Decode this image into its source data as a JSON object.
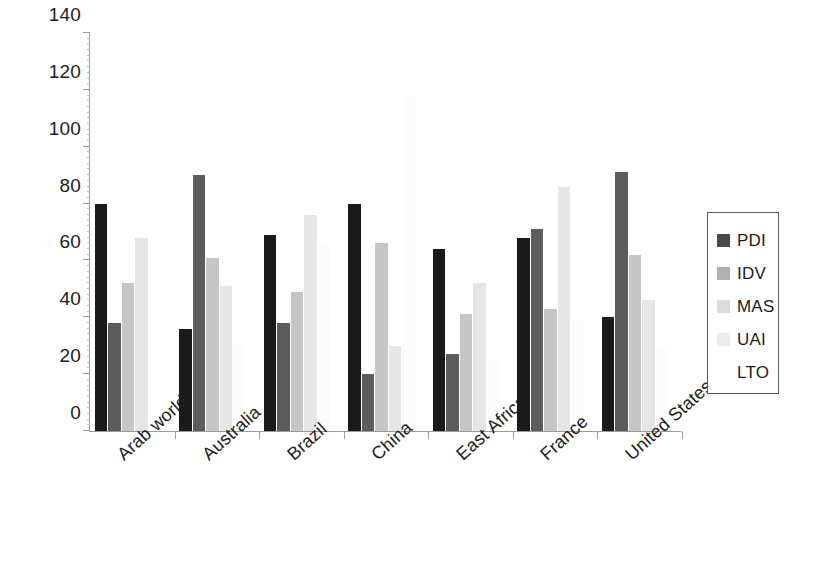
{
  "chart_data": {
    "type": "bar",
    "title": "",
    "subtitle": "",
    "xlabel": "",
    "ylabel": "",
    "ylim": [
      0,
      140
    ],
    "yticks": [
      0,
      20,
      40,
      60,
      80,
      100,
      120,
      140
    ],
    "ytick_labels": [
      "0",
      "20",
      "40",
      "60",
      "80",
      "100",
      "120",
      "140"
    ],
    "grid": false,
    "legend_position": "right",
    "categories": [
      "Arab world",
      "Australia",
      "Brazil",
      "China",
      "East Africa",
      "France",
      "United States"
    ],
    "series": [
      {
        "name": "PDI",
        "color": "#1a1a1a",
        "values": [
          80,
          36,
          69,
          80,
          64,
          68,
          40
        ]
      },
      {
        "name": "IDV",
        "color": "#5c5c5c",
        "values": [
          38,
          90,
          38,
          20,
          27,
          71,
          91
        ]
      },
      {
        "name": "MAS",
        "color": "#c6c6c6",
        "values": [
          52,
          61,
          49,
          66,
          41,
          43,
          62
        ]
      },
      {
        "name": "UAI",
        "color": "#e6e6e6",
        "values": [
          68,
          51,
          76,
          30,
          52,
          86,
          46
        ]
      },
      {
        "name": "LTO",
        "color": "#fcfcfc",
        "values": [
          0,
          31,
          65,
          118,
          25,
          39,
          29
        ]
      }
    ]
  },
  "legend": {
    "items": [
      {
        "label": "PDI",
        "swatch": "#4a4a4a"
      },
      {
        "label": "IDV",
        "swatch": "#b0b0b0"
      },
      {
        "label": "MAS",
        "swatch": "#dcdcdc"
      },
      {
        "label": "UAI",
        "swatch": "#ececec"
      },
      {
        "label": "LTO",
        "swatch": "#ffffff"
      }
    ]
  },
  "axis": {
    "y_min_label": "0",
    "y_max_label": "140"
  }
}
